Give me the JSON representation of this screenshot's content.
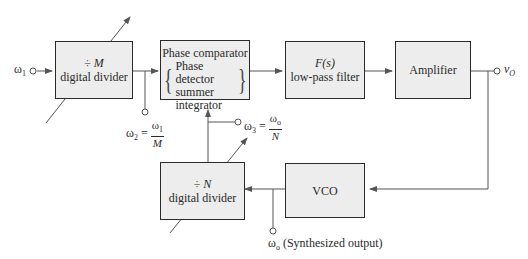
{
  "diagram": {
    "type": "block-diagram",
    "blocks": {
      "divider_m": {
        "line1_symbol": "÷",
        "line1_var": "M",
        "line2": "digital divider"
      },
      "phase_comparator": {
        "title": "Phase comparator",
        "items": [
          "Phase detector",
          "summer",
          "integrator"
        ]
      },
      "filter": {
        "line1": "F(s)",
        "line2": "low-pass filter"
      },
      "amplifier": {
        "label": "Amplifier"
      },
      "divider_n": {
        "line1_symbol": "÷",
        "line1_var": "N",
        "line2": "digital divider"
      },
      "vco": {
        "label": "VCO"
      }
    },
    "signals": {
      "input": {
        "symbol": "ω",
        "sub": "1"
      },
      "w2": {
        "lhs": "ω",
        "lhs_sub": "2",
        "eq": "=",
        "num": "ω",
        "num_sub": "1",
        "den": "M"
      },
      "w3": {
        "lhs": "ω",
        "lhs_sub": "3",
        "eq": "=",
        "num": "ω",
        "num_sub": "o",
        "den": "N"
      },
      "output": {
        "symbol": "v",
        "sub": "O"
      },
      "synth": {
        "symbol": "ω",
        "sub": "o",
        "text": "(Synthesized output)"
      }
    },
    "colors": {
      "block_fill": "#ededed",
      "stroke": "#2a2a2a",
      "wire": "#555555"
    }
  }
}
